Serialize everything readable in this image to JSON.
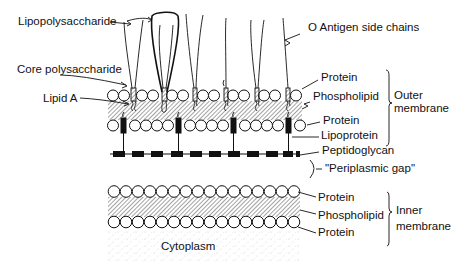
{
  "labels": {
    "lipopolysaccharide": "Lipopolysaccharide",
    "core_polysaccharide": "Core polysaccharide",
    "lipid_a": "Lipid A",
    "o_antigen": "O Antigen side chains",
    "outer_protein_top": "Protein",
    "outer_phospholipid": "Phospholipid",
    "outer_protein_bottom": "Protein",
    "lipoprotein": "Lipoprotein",
    "peptidoglycan": "Peptidoglycan",
    "periplasmic_gap": "\"Periplasmic gap\"",
    "inner_protein_top": "Protein",
    "inner_phospholipid": "Phospholipid",
    "inner_protein_bottom": "Protein",
    "cytoplasm": "Cytoplasm",
    "outer_membrane_line1": "Outer",
    "outer_membrane_line2": "membrane",
    "inner_membrane_line1": "Inner",
    "inner_membrane_line2": "membrane"
  },
  "colors": {
    "ink": "#111111",
    "hatch": "#555555",
    "background": "#ffffff"
  }
}
